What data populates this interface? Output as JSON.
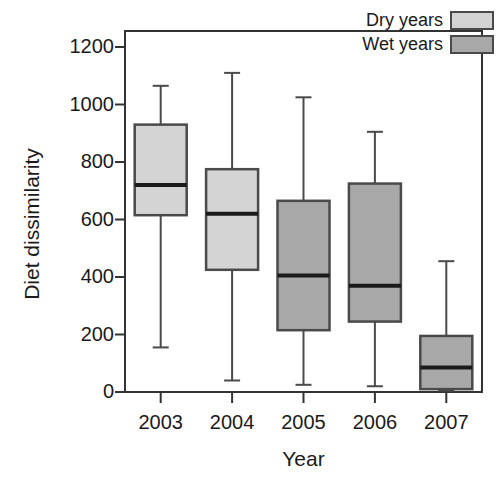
{
  "chart_data": {
    "type": "box",
    "title": "",
    "xlabel": "Year",
    "ylabel": "Diet dissimilarity",
    "categories": [
      "2003",
      "2004",
      "2005",
      "2006",
      "2007"
    ],
    "ylim": [
      0,
      1200
    ],
    "yticks": [
      0,
      200,
      400,
      600,
      800,
      1000,
      1200
    ],
    "ytick_labels": [
      "0",
      "200",
      "400",
      "600",
      "800",
      "1000",
      "1200"
    ],
    "grid": false,
    "legend_position": "top-right",
    "legend": [
      {
        "name": "Dry years",
        "color": "#d4d4d4"
      },
      {
        "name": "Wet years",
        "color": "#a8a8a8"
      }
    ],
    "boxes": [
      {
        "category": "2003",
        "group": "Dry years",
        "color": "#d4d4d4",
        "whisker_low": 155,
        "q1": 615,
        "median": 720,
        "q3": 930,
        "whisker_high": 1065
      },
      {
        "category": "2004",
        "group": "Dry years",
        "color": "#d4d4d4",
        "whisker_low": 40,
        "q1": 425,
        "median": 620,
        "q3": 775,
        "whisker_high": 1110
      },
      {
        "category": "2005",
        "group": "Wet years",
        "color": "#a8a8a8",
        "whisker_low": 25,
        "q1": 215,
        "median": 405,
        "q3": 665,
        "whisker_high": 1025
      },
      {
        "category": "2006",
        "group": "Wet years",
        "color": "#a8a8a8",
        "whisker_low": 20,
        "q1": 245,
        "median": 370,
        "q3": 725,
        "whisker_high": 905
      },
      {
        "category": "2007",
        "group": "Wet years",
        "color": "#a8a8a8",
        "whisker_low": 5,
        "q1": 10,
        "median": 85,
        "q3": 195,
        "whisker_high": 455
      }
    ]
  },
  "axes": {
    "frame_color": "#333333",
    "text_color": "#1a1a1a"
  }
}
